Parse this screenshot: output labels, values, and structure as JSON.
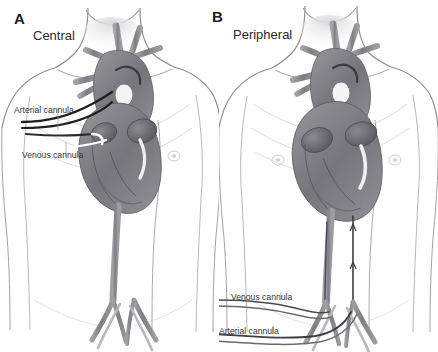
{
  "figure": {
    "kind": "medical-illustration",
    "style": "pencil-graphite-sketch",
    "background_color": "#ffffff",
    "ink_color": "#3a3a3a",
    "vessel_fill_color": "#8e8d93",
    "heart_shadow_color": "#6f6e74",
    "cannula_color": "#1f1f1f",
    "skin_line_color": "#9a9a9a"
  },
  "panels": [
    {
      "letter": "A",
      "title": "Central",
      "labels": [
        {
          "text": "Arterial cannula"
        },
        {
          "text": "Venous cannula"
        }
      ]
    },
    {
      "letter": "B",
      "title": "Peripheral",
      "labels": [
        {
          "text": "Venous cannula"
        },
        {
          "text": "Arterial cannula"
        }
      ]
    }
  ]
}
